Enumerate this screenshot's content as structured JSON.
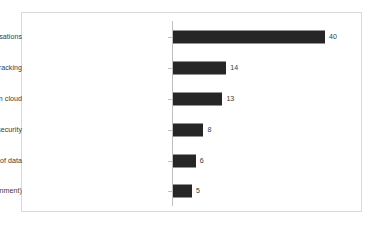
{
  "chart_data": {
    "type": "bar",
    "orientation": "horizontal",
    "title": "",
    "subtitle": "",
    "xlabel": "",
    "ylabel": "",
    "grid": false,
    "legend": false,
    "legend_position": "none",
    "axis_ticks_visible": true,
    "x_tick_labels": [],
    "xlim": [
      0,
      45
    ],
    "bar_color": "#262626",
    "frame_color": "#d9d9d9",
    "axis_color": "#bfbfbf",
    "label_color": "#3a3a3a",
    "categories": [
      "Always listening to conversations",
      "User tracking",
      "Storage of data in cloud",
      "Data security",
      "Hacking of data",
      "Sharing (public/3rd party/government)"
    ],
    "values": [
      40,
      14,
      13,
      8,
      6,
      5
    ],
    "value_labels": [
      "40",
      "14",
      "13",
      "8",
      "6",
      "5"
    ]
  }
}
